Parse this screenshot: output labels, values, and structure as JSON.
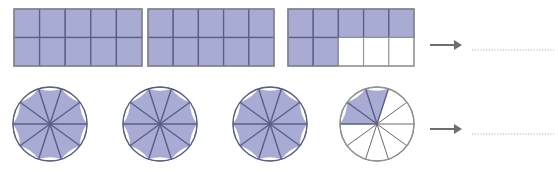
{
  "worksheet": {
    "title": "Mixed number fraction models",
    "background_color": "#ffffff",
    "fill_color": "#a8abd4",
    "stroke_color": "#5a5f85",
    "outline_color": "#8f8f8f",
    "arrow_color": "#6e6e6e",
    "answer_line_color": "#c9c9c9"
  },
  "rows": [
    {
      "id": "row-rectangles",
      "shape_type": "rectangle",
      "label": "Rectangle models row",
      "parts_per_whole": 10,
      "grid_columns": 5,
      "grid_rows": 2,
      "models": [
        {
          "name": "rectangle-model-1",
          "filled_parts": 10,
          "total_parts": 10,
          "fraction_text": "10/10"
        },
        {
          "name": "rectangle-model-2",
          "filled_parts": 10,
          "total_parts": 10,
          "fraction_text": "10/10"
        },
        {
          "name": "rectangle-model-3",
          "filled_parts": 7,
          "total_parts": 10,
          "fraction_text": "7/10"
        }
      ],
      "arrow": {
        "name": "arrow-right-icon",
        "direction": "right"
      },
      "answer": {
        "name": "answer-blank",
        "value": "",
        "placeholder": ""
      }
    },
    {
      "id": "row-circles",
      "shape_type": "circle",
      "label": "Circle models row",
      "parts_per_whole": 10,
      "models": [
        {
          "name": "circle-model-1",
          "filled_parts": 10,
          "total_parts": 10,
          "fraction_text": "10/10"
        },
        {
          "name": "circle-model-2",
          "filled_parts": 10,
          "total_parts": 10,
          "fraction_text": "10/10"
        },
        {
          "name": "circle-model-3",
          "filled_parts": 10,
          "total_parts": 10,
          "fraction_text": "10/10"
        },
        {
          "name": "circle-model-4",
          "filled_parts": 3,
          "total_parts": 10,
          "fraction_text": "3/10"
        }
      ],
      "arrow": {
        "name": "arrow-right-icon",
        "direction": "right"
      },
      "answer": {
        "name": "answer-blank",
        "value": "",
        "placeholder": ""
      }
    }
  ],
  "geometry": {
    "rectangles": [
      {
        "x": 14,
        "y": 9,
        "w": 128,
        "h": 57
      },
      {
        "x": 148,
        "y": 9,
        "w": 126,
        "h": 57
      },
      {
        "x": 288,
        "y": 9,
        "w": 126,
        "h": 57
      }
    ],
    "circles": [
      {
        "cx": 50,
        "cy": 124,
        "r": 37
      },
      {
        "cx": 160,
        "cy": 124,
        "r": 37
      },
      {
        "cx": 270,
        "cy": 124,
        "r": 37
      },
      {
        "cx": 377,
        "cy": 124,
        "r": 37
      }
    ],
    "arrows": [
      {
        "x1": 430,
        "y1": 45,
        "x2": 462,
        "y2": 45
      },
      {
        "x1": 430,
        "y1": 129,
        "x2": 462,
        "y2": 129
      }
    ],
    "answer_lines": [
      {
        "x": 472,
        "y": 50,
        "w": 82
      },
      {
        "x": 472,
        "y": 134,
        "w": 82
      }
    ]
  }
}
